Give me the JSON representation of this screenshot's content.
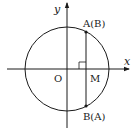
{
  "diagram": {
    "type": "unit-circle-chord",
    "axes": {
      "x_label": "x",
      "y_label": "y",
      "origin_label": "O"
    },
    "points": {
      "top": "A(B)",
      "bottom": "B(A)",
      "foot": "M"
    },
    "geometry": {
      "center": [
        67,
        69
      ],
      "radius": 42,
      "chord_x": 86,
      "top_point_y": 32,
      "bottom_point_y": 106,
      "right_angle_at": "M"
    },
    "colors": {
      "stroke": "#1a1a1a",
      "background": "#ffffff"
    }
  }
}
